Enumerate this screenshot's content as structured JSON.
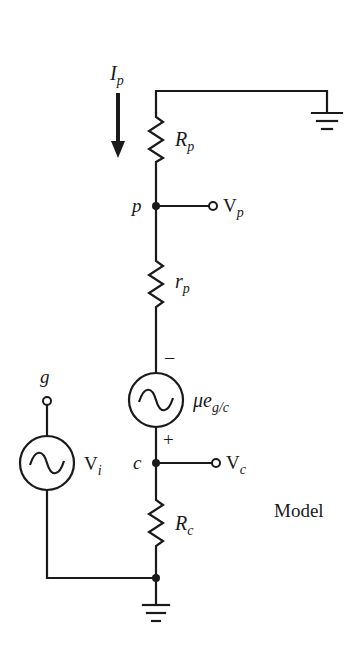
{
  "diagram": {
    "title": "Model",
    "current": {
      "symbol": "I",
      "sub": "p"
    },
    "components": {
      "Rp": {
        "symbol": "R",
        "sub": "p",
        "type": "resistor"
      },
      "rp": {
        "symbol": "r",
        "sub": "p",
        "type": "resistor"
      },
      "source_mu": {
        "symbol": "μe",
        "sub": "g/c",
        "type": "ac-voltage-source",
        "minus": "−",
        "plus": "+"
      },
      "Rc": {
        "symbol": "R",
        "sub": "c",
        "type": "resistor"
      },
      "Vi": {
        "symbol": "V",
        "sub": "i",
        "type": "ac-voltage-source"
      }
    },
    "nodes": {
      "p": "p",
      "c": "c",
      "g": "g"
    },
    "terminals": {
      "Vp": {
        "symbol": "V",
        "sub": "p"
      },
      "Vc": {
        "symbol": "V",
        "sub": "c"
      }
    }
  }
}
